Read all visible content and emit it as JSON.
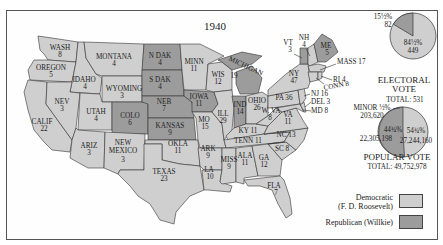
{
  "title": "1940",
  "colors": {
    "democratic": "#cfcfcf",
    "republican": "#9c9c9c",
    "border": "#333333"
  },
  "states": [
    {
      "abbr": "WASH",
      "ev": "8",
      "party": "democratic"
    },
    {
      "abbr": "OREGON",
      "ev": "5",
      "party": "democratic"
    },
    {
      "abbr": "CALIF",
      "ev": "22",
      "party": "democratic"
    },
    {
      "abbr": "IDAHO",
      "ev": "4",
      "party": "democratic"
    },
    {
      "abbr": "NEV",
      "ev": "3",
      "party": "democratic"
    },
    {
      "abbr": "MONTANA",
      "ev": "4",
      "party": "democratic"
    },
    {
      "abbr": "WYOMING",
      "ev": "3",
      "party": "democratic"
    },
    {
      "abbr": "UTAH",
      "ev": "4",
      "party": "democratic"
    },
    {
      "abbr": "ARIZ",
      "ev": "3",
      "party": "democratic"
    },
    {
      "abbr": "COLO",
      "ev": "6",
      "party": "republican"
    },
    {
      "abbr": "NEW MEXICO",
      "ev": "3",
      "party": "democratic"
    },
    {
      "abbr": "N DAK",
      "ev": "4",
      "party": "republican"
    },
    {
      "abbr": "S DAK",
      "ev": "4",
      "party": "republican"
    },
    {
      "abbr": "NEB",
      "ev": "7",
      "party": "republican"
    },
    {
      "abbr": "KANSAS",
      "ev": "9",
      "party": "republican"
    },
    {
      "abbr": "OKLA",
      "ev": "11",
      "party": "democratic"
    },
    {
      "abbr": "TEXAS",
      "ev": "23",
      "party": "democratic"
    },
    {
      "abbr": "MINN",
      "ev": "11",
      "party": "democratic"
    },
    {
      "abbr": "IOWA",
      "ev": "11",
      "party": "republican"
    },
    {
      "abbr": "MO",
      "ev": "15",
      "party": "democratic"
    },
    {
      "abbr": "ARK",
      "ev": "9",
      "party": "democratic"
    },
    {
      "abbr": "LA",
      "ev": "10",
      "party": "democratic"
    },
    {
      "abbr": "WIS",
      "ev": "12",
      "party": "democratic"
    },
    {
      "abbr": "ILL",
      "ev": "29",
      "party": "democratic"
    },
    {
      "abbr": "MICHIGAN",
      "ev": "19",
      "party": "republican"
    },
    {
      "abbr": "IND",
      "ev": "14",
      "party": "republican"
    },
    {
      "abbr": "OHIO",
      "ev": "26",
      "party": "democratic"
    },
    {
      "abbr": "KY",
      "ev": "11",
      "party": "democratic"
    },
    {
      "abbr": "TENN",
      "ev": "11",
      "party": "democratic"
    },
    {
      "abbr": "MISS",
      "ev": "9",
      "party": "democratic"
    },
    {
      "abbr": "ALA",
      "ev": "11",
      "party": "democratic"
    },
    {
      "abbr": "GA",
      "ev": "12",
      "party": "democratic"
    },
    {
      "abbr": "FLA",
      "ev": "7",
      "party": "democratic"
    },
    {
      "abbr": "SC",
      "ev": "8",
      "party": "democratic"
    },
    {
      "abbr": "NC",
      "ev": "13",
      "party": "democratic"
    },
    {
      "abbr": "VA",
      "ev": "11",
      "party": "democratic"
    },
    {
      "abbr": "W. VA",
      "ev": "8",
      "party": "democratic"
    },
    {
      "abbr": "PA",
      "ev": "36",
      "party": "democratic"
    },
    {
      "abbr": "NY",
      "ev": "47",
      "party": "democratic"
    },
    {
      "abbr": "VT",
      "ev": "3",
      "party": "republican"
    },
    {
      "abbr": "NH",
      "ev": "4",
      "party": "democratic"
    },
    {
      "abbr": "ME",
      "ev": "5",
      "party": "republican"
    },
    {
      "abbr": "MASS",
      "ev": "17",
      "party": "democratic"
    },
    {
      "abbr": "RI",
      "ev": "4",
      "party": "democratic"
    },
    {
      "abbr": "CONN",
      "ev": "8",
      "party": "democratic"
    },
    {
      "abbr": "NJ",
      "ev": "16",
      "party": "democratic"
    },
    {
      "abbr": "DEL",
      "ev": "3",
      "party": "democratic"
    },
    {
      "abbr": "MD",
      "ev": "8",
      "party": "democratic"
    }
  ],
  "labels": {
    "wash": "WASH",
    "wash_ev": "8",
    "oregon": "OREGON",
    "oregon_ev": "5",
    "calif": "CALIF",
    "calif_ev": "22",
    "idaho": "IDAHO",
    "idaho_ev": "4",
    "nev": "NEV",
    "nev_ev": "3",
    "montana": "MONTANA",
    "montana_ev": "4",
    "wyoming": "WYOMING",
    "wyoming_ev": "3",
    "utah": "UTAH",
    "utah_ev": "4",
    "ariz": "ARIZ",
    "ariz_ev": "3",
    "colo": "COLO",
    "colo_ev": "6",
    "newmex1": "NEW",
    "newmex2": "MEXICO",
    "newmex_ev": "3",
    "ndak": "N DAK",
    "ndak_ev": "4",
    "sdak": "S DAK",
    "sdak_ev": "4",
    "neb": "NEB",
    "neb_ev": "7",
    "kansas": "KANSAS",
    "kansas_ev": "9",
    "okla": "OKLA",
    "okla_ev": "11",
    "texas": "TEXAS",
    "texas_ev": "23",
    "minn": "MINN",
    "minn_ev": "11",
    "iowa": "IOWA",
    "iowa_ev": "11",
    "mo": "MO",
    "mo_ev": "15",
    "ark": "ARK",
    "ark_ev": "9",
    "la": "LA",
    "la_ev": "10",
    "wis": "WIS",
    "wis_ev": "12",
    "ill": "ILL",
    "ill_ev": "29",
    "michigan": "MICHIGAN",
    "michigan_ev": "19",
    "ind": "IND",
    "ind_ev": "14",
    "ohio": "OHIO",
    "ohio_ev": "26",
    "ky": "KY 11",
    "tenn": "TENN 11",
    "miss": "MISS",
    "miss_ev": "9",
    "ala": "ALA",
    "ala_ev": "11",
    "ga": "GA",
    "ga_ev": "12",
    "fla": "FLA",
    "fla_ev": "7",
    "sc": "SC 8",
    "nc": "NC 13",
    "va": "VA",
    "va_ev": "11",
    "wva": "W. VA",
    "wva_ev": "8",
    "pa": "PA 36",
    "ny": "NY",
    "ny_ev": "47",
    "vt": "VT",
    "vt_ev": "3",
    "nh": "NH",
    "nh_ev": "4",
    "me": "ME",
    "me_ev": "5",
    "mass": "MASS 17",
    "ri": "RI 4",
    "conn": "CONN 8",
    "nj": "NJ 16",
    "del": "DEL 3",
    "md": "MD 8"
  },
  "electoral_vote": {
    "heading1": "ELECTORAL",
    "heading2": "VOTE",
    "total_label": "TOTAL: 531",
    "republican_pct": "15½%",
    "republican_votes": "82",
    "democratic_pct": "84½%",
    "democratic_votes": "449"
  },
  "popular_vote": {
    "heading": "POPULAR VOTE",
    "total_label": "TOTAL: 49,752,978",
    "minor_label": "MINOR ½%",
    "minor_votes": "203,620",
    "republican_pct": "44¾%",
    "republican_votes": "22,305,198",
    "democratic_pct": "54¾%",
    "democratic_votes": "27,244,160"
  },
  "legend": {
    "democratic_line1": "Democratic",
    "democratic_line2": "(F. D. Roosevelt)",
    "republican": "Republican (Willkie)"
  }
}
